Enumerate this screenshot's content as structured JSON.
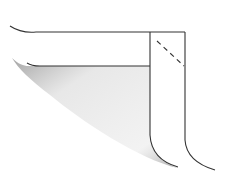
{
  "diagram": {
    "colors": {
      "stroke": "#333333",
      "shade": "#9a9a9a",
      "background": "#ffffff"
    },
    "labels": []
  }
}
